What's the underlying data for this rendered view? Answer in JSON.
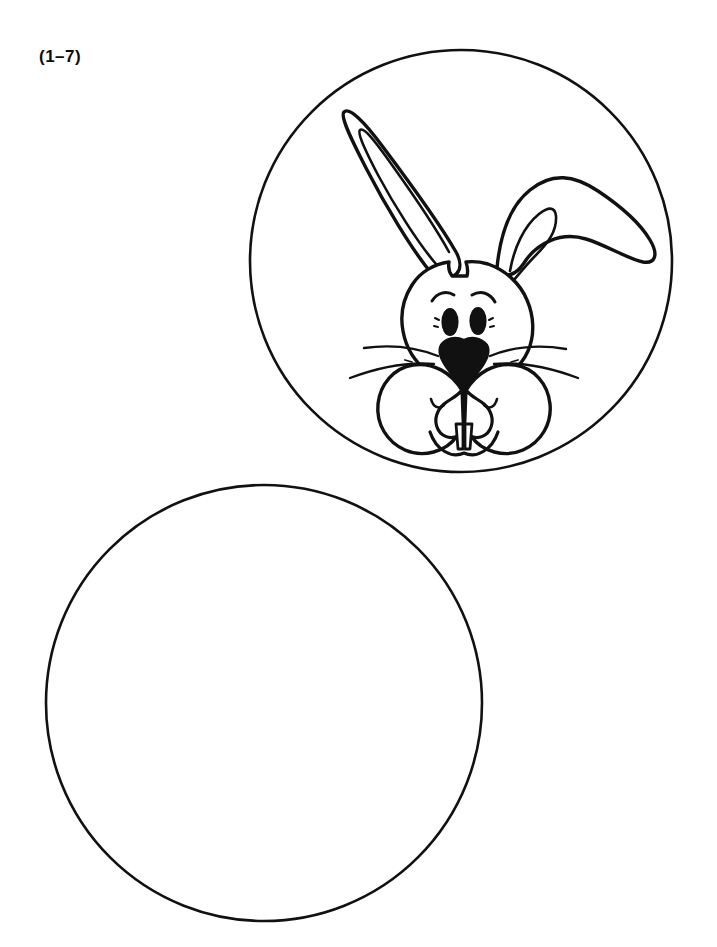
{
  "page": {
    "background_color": "#ffffff",
    "ink_color": "#111111",
    "width": 717,
    "height": 947
  },
  "exercise": {
    "label": "(1–7)"
  },
  "figures": [
    {
      "name": "bunny-circle",
      "type": "circle-with-illustration",
      "filled": false,
      "center_x": 461,
      "center_y": 261,
      "radius": 211,
      "illustration": "rabbit-face",
      "illustration_description": "Cartoon rabbit head with one upright ear, one floppy ear, two oval eyes, eyebrows, black triangular nose, whiskers, two round cheek puffs and two buck teeth"
    },
    {
      "name": "empty-circle",
      "type": "circle-blank",
      "filled": false,
      "center_x": 264,
      "center_y": 703,
      "radius": 218,
      "illustration": "none",
      "illustration_description": "Empty circle for the learner to draw in"
    }
  ],
  "rabbit_parts": {
    "head": "head-outline",
    "left_ear": "upright-ear",
    "right_ear": "floppy-ear",
    "eyes": "two-oval-eyes",
    "eyebrows": "two-arched-eyebrows",
    "nose": "black-triangle-nose",
    "whiskers": "six-whiskers",
    "cheeks": "two-round-cheek-puffs",
    "teeth": "two-buck-teeth",
    "mouth": "w-shaped-muzzle"
  }
}
